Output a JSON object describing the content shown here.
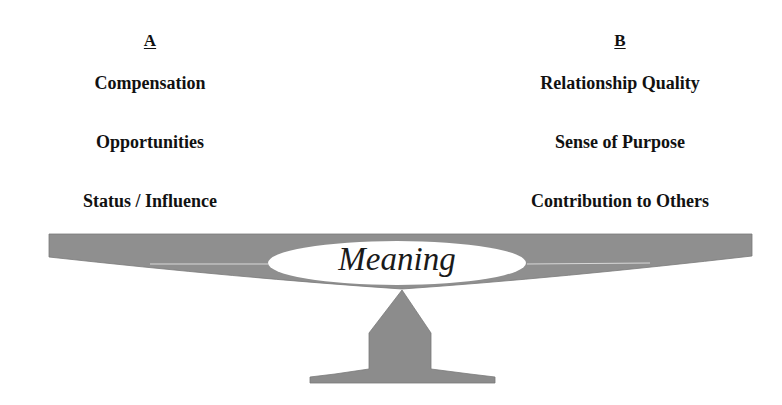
{
  "column_a": {
    "heading": "A",
    "items": [
      "Compensation",
      "Opportunities",
      "Status / Influence"
    ]
  },
  "column_b": {
    "heading": "B",
    "items": [
      "Relationship Quality",
      "Sense of Purpose",
      "Contribution to Others"
    ]
  },
  "balance": {
    "center_label": "Meaning",
    "colors": {
      "beam": "#8f8f8f",
      "fulcrum": "#8c8c8c",
      "ellipse": "#ffffff"
    }
  }
}
